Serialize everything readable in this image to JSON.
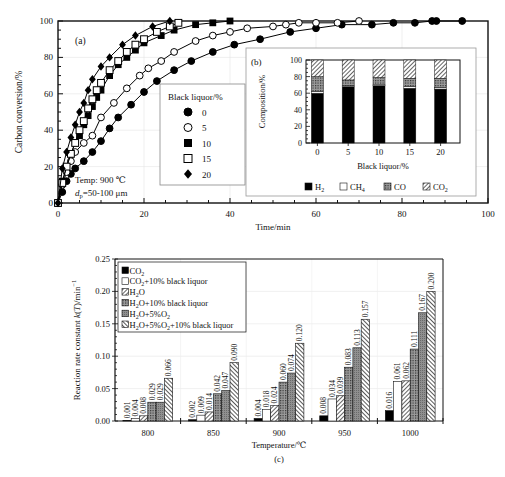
{
  "chart_data": [
    {
      "id": "a",
      "type": "scatter",
      "panel_label": "(a)",
      "title": "",
      "xlabel": "Time/min",
      "ylabel": "Carbon conversion/%",
      "xlim": [
        0,
        100
      ],
      "ylim": [
        0,
        100
      ],
      "xticks": [
        0,
        20,
        40,
        60,
        80,
        100
      ],
      "yticks": [
        0,
        20,
        40,
        60,
        80,
        100
      ],
      "grid": true,
      "annotation": [
        "Temp: 900 ℃",
        "dp=50-100 μm"
      ],
      "legend": {
        "title": "Black liquor/%",
        "position": "center-left"
      },
      "series": [
        {
          "name": "0",
          "marker": "filled-circle",
          "x": [
            0,
            1,
            2,
            3,
            4,
            6,
            8,
            10,
            12,
            14,
            17,
            20,
            23,
            27,
            31,
            36,
            41,
            47,
            54,
            60,
            66,
            73,
            78,
            83,
            87,
            88,
            94
          ],
          "y": [
            0,
            6,
            12,
            16,
            19,
            23,
            28,
            34,
            41,
            47,
            54,
            61,
            67,
            73,
            78,
            83,
            87,
            90,
            94,
            96,
            98,
            98,
            99,
            99,
            100,
            100,
            100
          ]
        },
        {
          "name": "5",
          "marker": "open-circle",
          "x": [
            0,
            1,
            2,
            3,
            4,
            6,
            8,
            10,
            13,
            16,
            19,
            21,
            24,
            27,
            32,
            36,
            40,
            44,
            50,
            53,
            56,
            60,
            65,
            70
          ],
          "y": [
            0,
            10,
            17,
            23,
            28,
            33,
            37,
            47,
            55,
            63,
            70,
            74,
            78,
            83,
            89,
            92,
            94,
            96,
            97,
            98,
            99,
            99,
            99,
            100
          ]
        },
        {
          "name": "10",
          "marker": "filled-square",
          "x": [
            0,
            1,
            2,
            3,
            4,
            5,
            6,
            7,
            8,
            9,
            10,
            12,
            14,
            16,
            18,
            20,
            24,
            27,
            32,
            36,
            40
          ],
          "y": [
            0,
            12,
            20,
            27,
            33,
            37,
            43,
            48,
            53,
            58,
            62,
            70,
            76,
            80,
            84,
            88,
            92,
            95,
            98,
            99,
            100
          ]
        },
        {
          "name": "15",
          "marker": "open-square",
          "x": [
            0,
            1,
            2,
            3,
            4,
            5,
            6,
            7,
            8,
            9,
            10,
            12,
            14,
            16,
            18,
            20,
            23,
            26,
            28
          ],
          "y": [
            0,
            11,
            20,
            27,
            33,
            40,
            45,
            52,
            57,
            62,
            66,
            73,
            78,
            83,
            87,
            90,
            94,
            97,
            99
          ]
        },
        {
          "name": "20",
          "marker": "filled-diamond",
          "x": [
            0,
            1,
            2,
            3,
            4,
            5,
            6,
            7,
            8,
            10,
            12,
            15,
            18,
            22,
            26
          ],
          "y": [
            0,
            19,
            28,
            36,
            43,
            50,
            55,
            62,
            68,
            75,
            80,
            87,
            92,
            97,
            100
          ]
        }
      ]
    },
    {
      "id": "b",
      "type": "bar",
      "stacked": true,
      "panel_label": "(b)",
      "xlabel": "Black liquor/%",
      "ylabel": "Composition/%",
      "ylim": [
        0,
        100
      ],
      "yticks": [
        0,
        20,
        40,
        60,
        80,
        100
      ],
      "categories": [
        "0",
        "5",
        "10",
        "15",
        "20"
      ],
      "legend": {
        "position": "bottom"
      },
      "series": [
        {
          "name": "H2",
          "label": "H",
          "sub": "2",
          "pattern": "solid-black",
          "values": [
            60,
            68,
            69,
            66,
            65
          ]
        },
        {
          "name": "CH4",
          "label": "CH",
          "sub": "4",
          "pattern": "white",
          "values": [
            2,
            1,
            1,
            2,
            2
          ]
        },
        {
          "name": "CO",
          "label": "CO",
          "sub": "",
          "pattern": "dots",
          "values": [
            18,
            7,
            9,
            10,
            11
          ]
        },
        {
          "name": "CO2",
          "label": "CO",
          "sub": "2",
          "pattern": "diagonal",
          "values": [
            20,
            24,
            21,
            22,
            22
          ]
        }
      ]
    },
    {
      "id": "c",
      "type": "bar",
      "panel_label": "(c)",
      "xlabel": "Temperature/℃",
      "ylabel": "Reaction rate constant k(T)/min⁻¹",
      "ylim": [
        0,
        0.25
      ],
      "yticks": [
        "0.00",
        "0.05",
        "0.10",
        "0.15",
        "0.20",
        "0.25"
      ],
      "grid": true,
      "categories": [
        "800",
        "850",
        "900",
        "950",
        "1000"
      ],
      "legend": {
        "position": "upper-left"
      },
      "series": [
        {
          "name": "CO2",
          "pattern": "solid-black",
          "values": [
            0.001,
            0.002,
            0.004,
            0.008,
            0.016
          ],
          "labels": [
            "0.001",
            "0.002",
            "0.004",
            "0.008",
            "0.016"
          ]
        },
        {
          "name": "CO2+10% black liquor",
          "pattern": "white",
          "values": [
            0.004,
            0.009,
            0.018,
            0.034,
            0.061
          ],
          "labels": [
            "0.004",
            "0.009",
            "0.018",
            "0.034",
            "0.061"
          ]
        },
        {
          "name": "H2O",
          "pattern": "diagonal",
          "values": [
            0.008,
            0.014,
            0.024,
            0.039,
            0.062
          ],
          "labels": [
            "0.008",
            "0.014",
            "0.024",
            "0.039",
            "0.062"
          ]
        },
        {
          "name": "H2O+10% black liquor",
          "pattern": "dots",
          "values": [
            0.029,
            0.042,
            0.06,
            0.083,
            0.111
          ],
          "labels": [
            "0.029",
            "0.042",
            "0.060",
            "0.083",
            "0.111"
          ]
        },
        {
          "name": "H2O+5%O2",
          "pattern": "grey",
          "values": [
            0.029,
            0.047,
            0.074,
            0.113,
            0.167
          ],
          "labels": [
            "0.029",
            "0.047",
            "0.074",
            "0.113",
            "0.167"
          ]
        },
        {
          "name": "H2O+5%O2+10% black liquor",
          "pattern": "back-diagonal",
          "values": [
            0.066,
            0.09,
            0.12,
            0.157,
            0.2
          ],
          "labels": [
            "0.066",
            "0.090",
            "0.120",
            "0.157",
            "0.200"
          ]
        }
      ],
      "legend_labels": [
        {
          "parts": [
            [
              "CO",
              ""
            ],
            [
              "2",
              "sub"
            ]
          ]
        },
        {
          "parts": [
            [
              "CO",
              ""
            ],
            [
              "2",
              "sub"
            ],
            [
              "+10% black liquor",
              ""
            ]
          ]
        },
        {
          "parts": [
            [
              "H",
              ""
            ],
            [
              "2",
              "sub"
            ],
            [
              "O",
              ""
            ]
          ]
        },
        {
          "parts": [
            [
              "H",
              ""
            ],
            [
              "2",
              "sub"
            ],
            [
              "O+10% black liquor",
              ""
            ]
          ]
        },
        {
          "parts": [
            [
              "H",
              ""
            ],
            [
              "2",
              "sub"
            ],
            [
              "O+5%O",
              ""
            ],
            [
              "2",
              "sub"
            ]
          ]
        },
        {
          "parts": [
            [
              "H",
              ""
            ],
            [
              "2",
              "sub"
            ],
            [
              "O+5%O",
              ""
            ],
            [
              "2",
              "sub"
            ],
            [
              "+10% black liquor",
              ""
            ]
          ]
        }
      ]
    }
  ]
}
